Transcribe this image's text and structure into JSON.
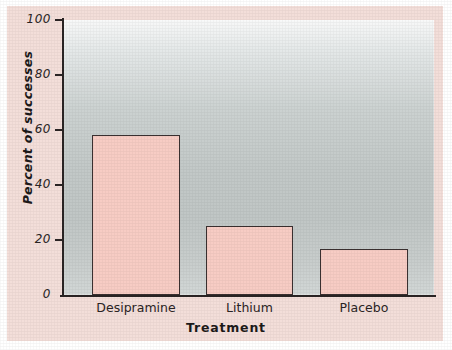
{
  "chart_data": {
    "type": "bar",
    "title": "",
    "categories": [
      "Desipramine",
      "Lithium",
      "Placebo"
    ],
    "values": [
      58.3,
      25.0,
      16.7
    ],
    "xlabel": "Treatment",
    "ylabel": "Percent of successes",
    "ylim": [
      0,
      100
    ],
    "yticks": [
      "0",
      "20",
      "40",
      "60",
      "80",
      "100"
    ],
    "ytick_values": [
      0,
      20,
      40,
      60,
      80,
      100
    ],
    "grid": false,
    "legend": "none",
    "bar_fill_color": "#f7ccc4",
    "bar_edge_color": "#3a3030",
    "plot_background": "#c2c8c7",
    "figure_background": "#f3ded9"
  },
  "axis": {
    "y_ticks": [
      {
        "label": "100",
        "value": 100
      },
      {
        "label": "80",
        "value": 80
      },
      {
        "label": "60",
        "value": 60
      },
      {
        "label": "40",
        "value": 40
      },
      {
        "label": "20",
        "value": 20
      },
      {
        "label": "0",
        "value": 0
      }
    ],
    "y_title": "Percent of successes",
    "x_title": "Treatment"
  },
  "bars": [
    {
      "label": "Desipramine",
      "value": 58.3
    },
    {
      "label": "Lithium",
      "value": 25.0
    },
    {
      "label": "Placebo",
      "value": 16.7
    }
  ]
}
